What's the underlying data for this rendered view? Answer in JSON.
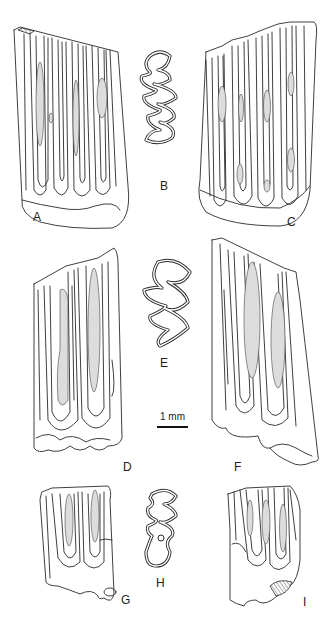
{
  "figure": {
    "panels": [
      {
        "id": "A",
        "label": "A",
        "view": "lateral view of tooth, elongated crown with multiple folds"
      },
      {
        "id": "B",
        "label": "B",
        "view": "occlusal outline"
      },
      {
        "id": "C",
        "label": "C",
        "view": "lateral view of tooth, opposite side"
      },
      {
        "id": "D",
        "label": "D",
        "view": "lateral view of tooth"
      },
      {
        "id": "E",
        "label": "E",
        "view": "occlusal outline"
      },
      {
        "id": "F",
        "label": "F",
        "view": "lateral view of tooth, opposite side"
      },
      {
        "id": "G",
        "label": "G",
        "view": "lateral view of small tooth"
      },
      {
        "id": "H",
        "label": "H",
        "view": "occlusal outline"
      },
      {
        "id": "I",
        "label": "I",
        "view": "lateral view of small tooth, opposite side"
      }
    ],
    "scale_bar": {
      "label": "1 mm"
    }
  },
  "colors": {
    "line": "#2a2a2a",
    "stipple": "#bdbdbd",
    "background": "#ffffff"
  }
}
